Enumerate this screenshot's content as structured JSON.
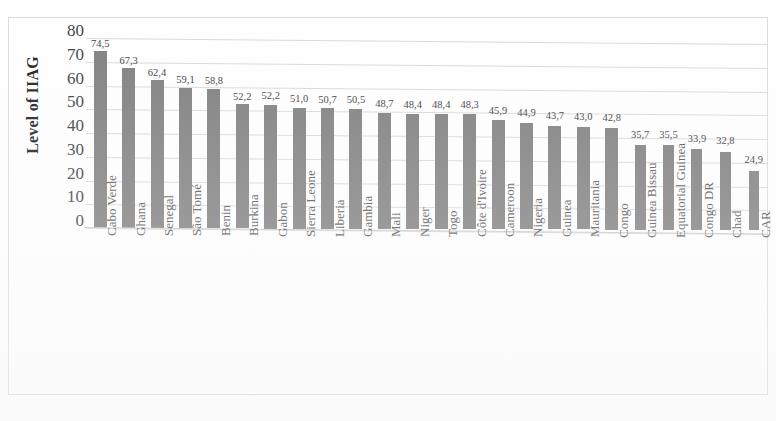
{
  "chart_data": {
    "type": "bar",
    "title": "",
    "xlabel": "",
    "ylabel": "Level of IIAG",
    "ylim": [
      0,
      80
    ],
    "ytick_step": 10,
    "ytick_labels": [
      "80",
      "70",
      "60",
      "50",
      "40",
      "30",
      "20",
      "10",
      "0"
    ],
    "grid": true,
    "legend": "none",
    "decimal_separator": ",",
    "bar_color": "#7f7f7f",
    "gridline_color": "#d9d9d9",
    "categories": [
      "Cabo Verde",
      "Ghana",
      "Senegal",
      "São Tomé",
      "Benin",
      "Burkina",
      "Gabon",
      "Sierra Leone",
      "Liberia",
      "Gambia",
      "Mali",
      "Niger",
      "Togo",
      "Côte d'Ivoire",
      "Cameroon",
      "Nigeria",
      "Guinea",
      "Mauritania",
      "Congo",
      "Guinea Bissau",
      "Equatorial Guinea",
      "Congo DR",
      "Chad",
      "CAR"
    ],
    "values": [
      74.5,
      67.3,
      62.4,
      59.1,
      58.8,
      52.2,
      52.2,
      51.0,
      50.7,
      50.5,
      48.7,
      48.4,
      48.4,
      48.3,
      45.9,
      44.9,
      43.7,
      43.0,
      42.8,
      35.7,
      35.5,
      33.9,
      32.8,
      24.9
    ],
    "value_labels": [
      "74,5",
      "67,3",
      "62,4",
      "59,1",
      "58,8",
      "52,2",
      "52,2",
      "51,0",
      "50,7",
      "50,5",
      "48,7",
      "48,4",
      "48,4",
      "48,3",
      "45,9",
      "44,9",
      "43,7",
      "43,0",
      "42,8",
      "35,7",
      "35,5",
      "33,9",
      "32,8",
      "24,9"
    ]
  }
}
